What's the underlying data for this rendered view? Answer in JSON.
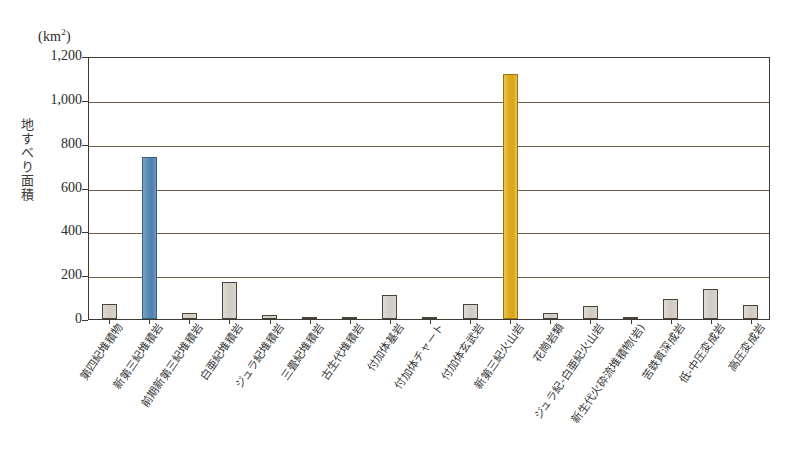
{
  "chart_data": {
    "type": "bar",
    "title": "",
    "subtitle": "",
    "unit_label": "km",
    "unit_exponent": "2",
    "ylabel": "地すべり面積",
    "xlabel": "",
    "ylim": [
      0,
      1200
    ],
    "ytick_values": [
      1200,
      1000,
      800,
      600,
      400,
      200,
      0
    ],
    "ytick_labels": [
      "1,200",
      "1,000",
      "800",
      "600",
      "400",
      "200",
      "0"
    ],
    "grid": true,
    "legend": "none",
    "categories": [
      "第四紀堆積物",
      "新第三紀堆積岩",
      "前期新第三紀堆積岩",
      "白亜紀堆積岩",
      "ジュラ紀堆積岩",
      "三畳紀堆積岩",
      "古生代堆積岩",
      "付加体基岩",
      "付加体チャート",
      "付加体玄武岩",
      "新第三紀火山岩",
      "花崗岩類",
      "ジュラ紀-白亜紀火山岩",
      "新生代火砕流堆積物(岩)",
      "苦鉄質深成岩",
      "低-中圧変成岩",
      "高圧変成岩"
    ],
    "values": [
      70,
      740,
      28,
      170,
      18,
      5,
      4,
      110,
      3,
      68,
      1120,
      28,
      58,
      6,
      90,
      135,
      62
    ],
    "bar_colors": [
      "#d2cec6",
      "#5b8db8",
      "#d2cec6",
      "#d2cec6",
      "#d2cec6",
      "#d2cec6",
      "#d2cec6",
      "#d2cec6",
      "#d2cec6",
      "#d2cec6",
      "#ddaa18",
      "#d2cec6",
      "#d2cec6",
      "#d2cec6",
      "#d2cec6",
      "#d2cec6",
      "#d2cec6"
    ],
    "highlight_colors": {
      "blue": "#5b8db8",
      "gold": "#ddaa18",
      "gray": "#d2cec6",
      "axis": "#3d3a33",
      "gridline": "#6b5f49"
    }
  }
}
